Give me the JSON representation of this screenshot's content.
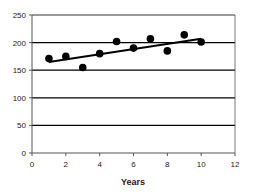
{
  "chart_data": {
    "type": "scatter",
    "title": "",
    "xlabel": "Years",
    "ylabel": "",
    "xlim": [
      0,
      12
    ],
    "ylim": [
      0,
      250
    ],
    "x_ticks": [
      0,
      2,
      4,
      6,
      8,
      10,
      12
    ],
    "y_ticks": [
      0,
      50,
      100,
      150,
      200,
      250
    ],
    "grid": "horizontal",
    "legend": "none",
    "series": [
      {
        "name": "data",
        "x": [
          1,
          2,
          3,
          4,
          5,
          6,
          7,
          8,
          9,
          10
        ],
        "y": [
          171,
          175,
          155,
          180,
          202,
          190,
          207,
          185,
          214,
          201
        ]
      }
    ],
    "trendline": {
      "type": "linear",
      "x": [
        1,
        10
      ],
      "y": [
        165,
        207
      ]
    }
  },
  "colors": {
    "points": "#000000",
    "trendline": "#000000",
    "grid": "#000000",
    "axis": "#555555"
  }
}
